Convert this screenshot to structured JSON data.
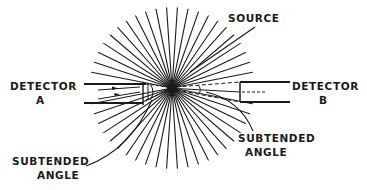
{
  "diagram": {
    "type": "radiation-source-detector-geometry",
    "colors": {
      "ink": "#1a1a1a",
      "background": "#ffffff"
    },
    "source": {
      "label": "SOURCE",
      "center": [
        172,
        88
      ],
      "ray_count": 48,
      "ray_inner_radius": 4,
      "ray_outer_radius": 82
    },
    "detector_a": {
      "label_line1": "DETECTOR",
      "label_line2": "A"
    },
    "detector_b": {
      "label_line1": "DETECTOR",
      "label_line2": "B"
    },
    "subtended_angle_a": {
      "label_line1": "SUBTENDED",
      "label_line2": "ANGLE"
    },
    "subtended_angle_b": {
      "label_line1": "SUBTENDED",
      "label_line2": "ANGLE"
    }
  }
}
